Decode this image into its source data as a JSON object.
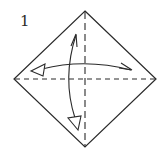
{
  "diagram": {
    "step_number": "1",
    "colors": {
      "line": "#2a2a2a",
      "background": "#ffffff"
    },
    "square": {
      "top": [
        85,
        11
      ],
      "right": [
        156,
        79
      ],
      "bottom": [
        85,
        147
      ],
      "left": [
        14,
        79
      ]
    },
    "crease_lines": [
      {
        "name": "horizontal-diagonal-valley",
        "type": "dashed",
        "from": [
          14,
          79
        ],
        "to": [
          156,
          79
        ]
      },
      {
        "name": "vertical-diagonal-valley",
        "type": "dashed",
        "from": [
          85,
          11
        ],
        "to": [
          85,
          147
        ]
      }
    ],
    "arrows": [
      {
        "name": "fold-and-unfold-horizontal",
        "from": [
          32,
          71
        ],
        "to": [
          132,
          70
        ],
        "arc_peak_y": 64,
        "start_head": "hollow-triangle",
        "end_head": "open-barb"
      },
      {
        "name": "fold-and-unfold-vertical",
        "from": [
          76,
          34
        ],
        "to": [
          77,
          129
        ],
        "arc_peak_x": 69,
        "start_head": "open-barb",
        "end_head": "hollow-triangle"
      }
    ]
  }
}
